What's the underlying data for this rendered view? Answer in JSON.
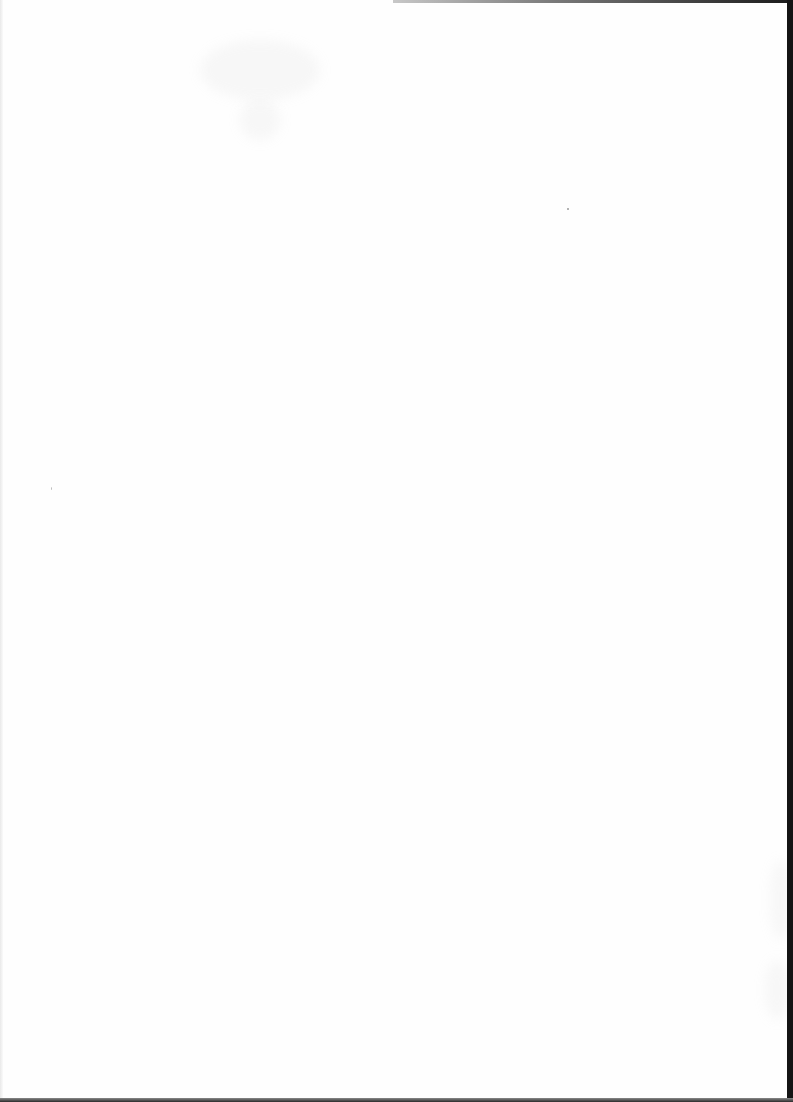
{
  "document": {
    "type": "scanned-page",
    "content": "",
    "page_background": "#fefefe",
    "border_color": "#141414"
  }
}
